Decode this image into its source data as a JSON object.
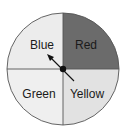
{
  "diagram": {
    "type": "spinner",
    "sections": [
      {
        "label": "Blue",
        "position": "top-left",
        "fill": "#ececec"
      },
      {
        "label": "Red",
        "position": "top-right",
        "fill": "#6b6b6b"
      },
      {
        "label": "Green",
        "position": "bottom-left",
        "fill": "#efefef"
      },
      {
        "label": "Yellow",
        "position": "bottom-right",
        "fill": "#e2e2e2"
      }
    ],
    "pointer": {
      "points_to": "Blue",
      "color": "#111111"
    },
    "outline_color": "#555555"
  }
}
